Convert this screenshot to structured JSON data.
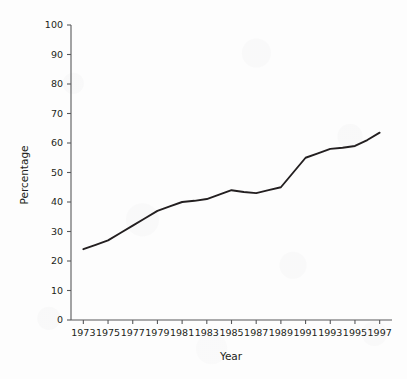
{
  "chart_data": {
    "type": "line",
    "title": "",
    "subtitle": "",
    "xlabel": "Year",
    "ylabel": "Percentage",
    "grid": false,
    "legend": false,
    "legend_position": "none",
    "line_color": "#231f20",
    "axis_color": "#58595b",
    "background_color": "#fdfdfd",
    "xlim": [
      1972,
      1998
    ],
    "ylim": [
      0,
      100
    ],
    "x": [
      1973,
      1974,
      1975,
      1976,
      1977,
      1978,
      1979,
      1980,
      1981,
      1982,
      1983,
      1984,
      1985,
      1986,
      1987,
      1988,
      1989,
      1990,
      1991,
      1992,
      1993,
      1994,
      1995,
      1996,
      1997
    ],
    "values": [
      24,
      25.5,
      27,
      29.5,
      32,
      34.5,
      37,
      38.5,
      40,
      40.4,
      41,
      42.5,
      44,
      43.4,
      43,
      44,
      45,
      50,
      55,
      56.5,
      58,
      58.4,
      59,
      61,
      63.5
    ],
    "series": [
      {
        "name": "Percentage",
        "values": [
          24,
          25.5,
          27,
          29.5,
          32,
          34.5,
          37,
          38.5,
          40,
          40.4,
          41,
          42.5,
          44,
          43.4,
          43,
          44,
          45,
          50,
          55,
          56.5,
          58,
          58.4,
          59,
          61,
          63.5
        ]
      }
    ],
    "x_tick_labels": [
      "1973",
      "1975",
      "1977",
      "1979",
      "1981",
      "1983",
      "1985",
      "1987",
      "1989",
      "1991",
      "1993",
      "1995",
      "1997"
    ],
    "x_tick_values": [
      1973,
      1975,
      1977,
      1979,
      1981,
      1983,
      1985,
      1987,
      1989,
      1991,
      1993,
      1995,
      1997
    ],
    "y_tick_labels": [
      "0",
      "10",
      "20",
      "30",
      "40",
      "50",
      "60",
      "70",
      "80",
      "90",
      "100"
    ],
    "y_tick_values": [
      0,
      10,
      20,
      30,
      40,
      50,
      60,
      70,
      80,
      90,
      100
    ],
    "annotations": []
  }
}
